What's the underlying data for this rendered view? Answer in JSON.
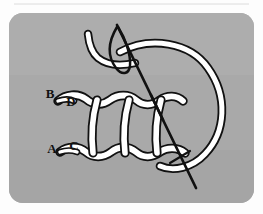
{
  "figure": {
    "name": "ladder-stitch-diagram",
    "card": {
      "background_color": "#a9a9a9",
      "corner_radius": 14,
      "outer_background_color": "#fdfdfd",
      "x": 9,
      "y": 13,
      "width": 245,
      "height": 190
    },
    "separator_line": {
      "name": "top-hairline",
      "color": "#d8d8d8",
      "y": 4
    },
    "thread": {
      "fill_color": "#ffffff",
      "outline_color": "#111111",
      "outline_width": 2.1
    },
    "needle": {
      "color": "#111111",
      "width": 2.6,
      "eye_shape": "elongated-loop"
    },
    "labels": [
      {
        "id": "B",
        "text": "B",
        "x": 50,
        "y": 98,
        "anchor": "stitch-upper-left-entry"
      },
      {
        "id": "D",
        "text": "D",
        "x": 71,
        "y": 106,
        "anchor": "stitch-upper-inner-entry"
      },
      {
        "id": "A",
        "text": "A",
        "x": 52,
        "y": 153,
        "anchor": "stitch-lower-left-entry"
      },
      {
        "id": "C",
        "text": "C",
        "x": 74,
        "y": 150,
        "anchor": "stitch-lower-inner-entry"
      }
    ],
    "rungs": [
      {
        "id": "rung-1",
        "x_top": 96,
        "x_bottom": 92
      },
      {
        "id": "rung-2",
        "x_top": 128,
        "x_bottom": 124
      },
      {
        "id": "rung-3",
        "x_top": 160,
        "x_bottom": 156
      }
    ]
  }
}
